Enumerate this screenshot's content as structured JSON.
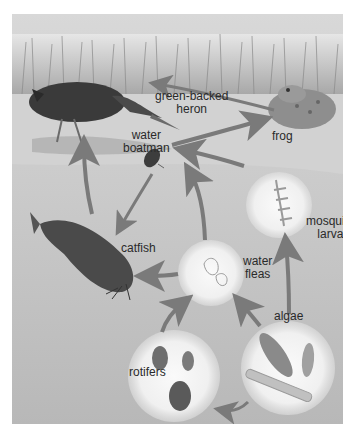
{
  "diagram": {
    "type": "food-web",
    "color_mode": "grayscale",
    "colors": {
      "background_page": "#ffffff",
      "sky_grass": "#d6d6d6",
      "shore": "#d9d9d9",
      "water": "#c4c4c4",
      "circle_highlight": "#f2f2f2",
      "arrow": "#7a7a7a",
      "label_text": "#2a2a2a"
    },
    "organisms": [
      {
        "id": "heron",
        "label_line1": "green-backed",
        "label_line2": "heron"
      },
      {
        "id": "frog",
        "label_line1": "frog"
      },
      {
        "id": "water_boatman",
        "label_line1": "water",
        "label_line2": "boatman"
      },
      {
        "id": "mosquito_larva",
        "label_line1": "mosquito",
        "label_line2": "larva"
      },
      {
        "id": "catfish",
        "label_line1": "catfish"
      },
      {
        "id": "water_fleas",
        "label_line1": "water",
        "label_line2": "fleas"
      },
      {
        "id": "algae",
        "label_line1": "algae"
      },
      {
        "id": "rotifers",
        "label_line1": "rotifers"
      }
    ],
    "arrows": [
      {
        "from": "frog",
        "to": "heron"
      },
      {
        "from": "water_boatman",
        "to": "frog"
      },
      {
        "from": "mosquito_larva",
        "to": "water_boatman"
      },
      {
        "from": "catfish",
        "to": "heron"
      },
      {
        "from": "water_boatman",
        "to": "catfish"
      },
      {
        "from": "water_fleas",
        "to": "water_boatman"
      },
      {
        "from": "water_fleas",
        "to": "catfish"
      },
      {
        "from": "algae",
        "to": "mosquito_larva"
      },
      {
        "from": "algae",
        "to": "water_fleas"
      },
      {
        "from": "rotifers",
        "to": "water_fleas"
      },
      {
        "from": "algae",
        "to": "rotifers"
      }
    ]
  }
}
